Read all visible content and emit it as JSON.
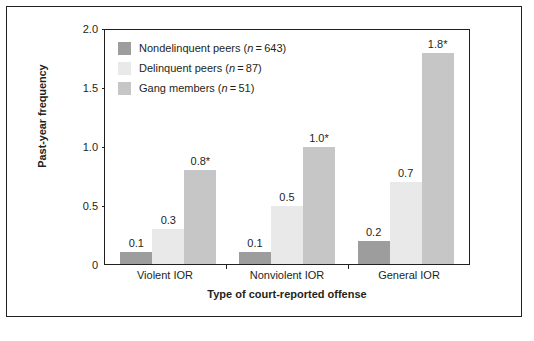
{
  "chart_data": {
    "type": "bar",
    "title": "",
    "xlabel": "Type of court-reported offense",
    "ylabel": "Past-year frequency",
    "categories": [
      "Violent IOR",
      "Nonviolent IOR",
      "General IOR"
    ],
    "series": [
      {
        "name": "Nondelinquent peers (n = 643)",
        "label_prefix": "Nondelinquent peers (",
        "label_n": "n",
        "label_suffix": " = 643)",
        "color": "#9d9d9d",
        "values": [
          0.1,
          0.1,
          0.2
        ],
        "value_labels": [
          "0.1",
          "0.1",
          "0.2"
        ]
      },
      {
        "name": "Delinquent peers (n = 87)",
        "label_prefix": "Delinquent peers (",
        "label_n": "n",
        "label_suffix": " = 87)",
        "color": "#e9e9e9",
        "values": [
          0.3,
          0.5,
          0.7
        ],
        "value_labels": [
          "0.3",
          "0.5",
          "0.7"
        ]
      },
      {
        "name": "Gang members (n = 51)",
        "label_prefix": "Gang members (",
        "label_n": "n",
        "label_suffix": " = 51)",
        "color": "#c6c6c6",
        "values": [
          0.8,
          1.0,
          1.8
        ],
        "value_labels": [
          "0.8*",
          "1.0*",
          "1.8*"
        ]
      }
    ],
    "ylim": [
      0,
      2.0
    ],
    "yticks": [
      0,
      0.5,
      1.0,
      1.5,
      2.0
    ],
    "ytick_labels": [
      "0",
      "0.5",
      "1.0",
      "1.5",
      "2.0"
    ],
    "grid": false,
    "legend_position": "top-left-inside"
  }
}
